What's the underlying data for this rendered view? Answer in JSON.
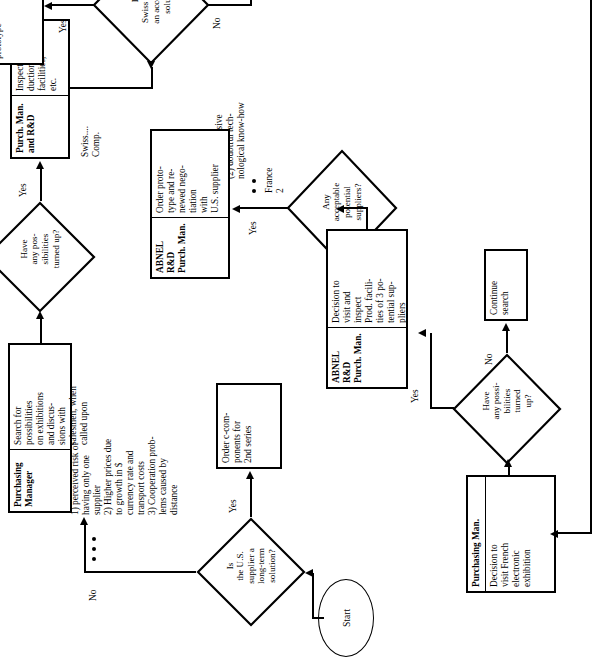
{
  "diagram": {
    "orientation": "rotated-90-ccw",
    "start": {
      "label": "Start"
    },
    "nodes": {
      "is_us_supplier": {
        "label": "Is\nthe U.S.\nsupplier a\nlong-term\nsolution?"
      },
      "order_components": {
        "label": "Order c-com-\nponents for\n2nd series"
      },
      "purchasing_manager_search": {
        "header": "Purchasing\nManager",
        "body": "Search for\npossibilities\non exhibitions\nand discus-\nsions with\nsalesmen, when\ncalled upon"
      },
      "have_possibilities_1": {
        "label": "Have\nany pos-\nsibilities\nturned up?"
      },
      "purch_man_rd_inspect": {
        "header": "Purch. Man.\nand R&D",
        "body": "Inspect pro-\nduction\nfacilities,\netc."
      },
      "is_swiss_acceptable": {
        "label": "Is\nSwiss Comp.\nan acceptable\nsolution"
      },
      "add_firm_approved": {
        "label": "Add firm\nto list of\napproved\nsuppliers for\nprototype"
      },
      "any_acceptable_suppliers": {
        "label": "Any\nacceptable\npotential\nsuppliers?"
      },
      "abnel_rd_order_prototype": {
        "header": "ABNEL R&D\nPurch. Man.",
        "body": "Order proto-\ntype and re-\nnewed nego-\ntiation\nwith\nU.S. supplier"
      },
      "abnel_rd_visit_inspect": {
        "header": "ABNEL R&D\nPurch. Man.",
        "body": "Decision to\nvisit and\ninspect\nProd. facili-\nties of 3 po-\ntential sup-\npliers"
      },
      "have_possibilities_2": {
        "label": "Have\nany possi-\nbilities\nturned\nup?"
      },
      "continue_search": {
        "label": "Continue\nsearch"
      },
      "purchasing_man_visit_exhibition": {
        "header": "Purchasing Man.",
        "body": "Decision to\nvisit French\nelectronic\nexhibition"
      }
    },
    "edge_labels": {
      "no_1": "No",
      "yes_order": "Yes",
      "yes_inspect": "Yes",
      "yes_add_firm": "Yes",
      "yes_prototype": "Yes",
      "yes_visit_inspect": "Yes",
      "no_continue": "No"
    },
    "annotations": {
      "reasons_us": "1) perceived risk of\n    having only one\n    supplier\n2) Higher prices due\n    to growth in $\n    currency rate and\n    transport costs\n3) Cooperation prob-\n    lems caused by\n    distance",
      "swiss_comp_label": "Swiss....\nComp.",
      "swiss_rejected": "Swiss firm\nrejected\n(1) too expensive\n(2) doubtful tech-\n     nological know-how",
      "france_label": "France\n2"
    },
    "colors": {
      "stroke": "#000000",
      "background": "#ffffff"
    }
  }
}
